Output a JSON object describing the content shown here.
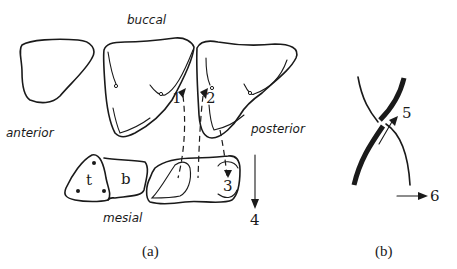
{
  "panel_a": {
    "labels": {
      "buccal": "buccal",
      "anterior": "anterior",
      "posterior": "posterior",
      "mesial": "mesial",
      "t": "t",
      "b": "b"
    },
    "numbers": {
      "n1": "1",
      "n2": "2",
      "n3": "3",
      "n4": "4"
    },
    "caption": "(a)"
  },
  "panel_b": {
    "numbers": {
      "n5": "5",
      "n6": "6"
    },
    "caption": "(b)"
  },
  "colors": {
    "ink": "#1a1a1a",
    "background": "#ffffff"
  }
}
